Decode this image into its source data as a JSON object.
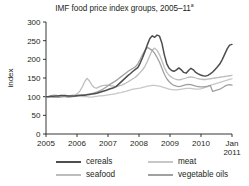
{
  "chart_data": {
    "type": "line",
    "title": "IMF food price index groups, 2005–11",
    "title_superscript": "a",
    "xlabel": "",
    "ylabel": "index",
    "ylim": [
      0,
      300
    ],
    "yticks": [
      0,
      50,
      100,
      150,
      200,
      250,
      300
    ],
    "xticks": [
      "2005",
      "2006",
      "2007",
      "2008",
      "2009",
      "2010",
      "Jan 2011"
    ],
    "xtick_last_line1": "Jan",
    "xtick_last_line2": "2011",
    "xlim": [
      2005.0,
      2011.0
    ],
    "grid": false,
    "legend_position": "below",
    "note": "Monthly index values, Jan 2005 = 100",
    "series": [
      {
        "name": "cereals",
        "color": "#4d4d4d",
        "values": [
          100,
          100,
          101,
          101,
          102,
          102,
          103,
          103,
          103,
          102,
          102,
          102,
          102,
          103,
          104,
          104,
          104,
          105,
          106,
          107,
          108,
          109,
          111,
          113,
          115,
          117,
          120,
          122,
          124,
          127,
          133,
          139,
          145,
          151,
          157,
          162,
          168,
          173,
          178,
          190,
          205,
          222,
          240,
          256,
          263,
          259,
          265,
          262,
          243,
          212,
          188,
          176,
          170,
          168,
          172,
          177,
          172,
          165,
          163,
          170,
          176,
          172,
          165,
          161,
          158,
          156,
          155,
          157,
          161,
          166,
          173,
          180,
          188,
          200,
          214,
          228,
          238,
          240
        ]
      },
      {
        "name": "seafood",
        "color": "#bdbdbd",
        "values": [
          100,
          101,
          103,
          104,
          104,
          103,
          102,
          101,
          101,
          102,
          103,
          104,
          105,
          108,
          115,
          126,
          140,
          149,
          142,
          131,
          124,
          123,
          126,
          129,
          130,
          131,
          130,
          129,
          128,
          127,
          128,
          130,
          133,
          136,
          140,
          144,
          148,
          152,
          158,
          165,
          172,
          182,
          195,
          210,
          225,
          230,
          224,
          212,
          196,
          178,
          165,
          157,
          152,
          148,
          146,
          145,
          146,
          148,
          150,
          152,
          153,
          152,
          150,
          148,
          147,
          146,
          146,
          147,
          148,
          149,
          150,
          151,
          152,
          153,
          154,
          155,
          156,
          157
        ]
      },
      {
        "name": "meat",
        "color": "#c7c7c7",
        "values": [
          100,
          100,
          100,
          99,
          99,
          99,
          100,
          100,
          100,
          100,
          101,
          101,
          101,
          101,
          101,
          100,
          100,
          100,
          99,
          99,
          100,
          101,
          102,
          102,
          103,
          104,
          105,
          106,
          107,
          108,
          110,
          111,
          113,
          114,
          116,
          118,
          120,
          121,
          122,
          123,
          125,
          126,
          128,
          129,
          130,
          130,
          129,
          128,
          126,
          124,
          122,
          120,
          119,
          118,
          118,
          119,
          120,
          121,
          122,
          122,
          122,
          121,
          120,
          120,
          121,
          123,
          125,
          127,
          130,
          132,
          134,
          136,
          138,
          140,
          142,
          144,
          146,
          148
        ]
      },
      {
        "name": "vegetable oils",
        "color": "#a0a0a0",
        "values": [
          100,
          100,
          99,
          99,
          98,
          98,
          99,
          100,
          100,
          99,
          99,
          100,
          101,
          102,
          103,
          104,
          105,
          106,
          107,
          108,
          110,
          112,
          115,
          118,
          122,
          126,
          131,
          135,
          139,
          143,
          148,
          153,
          158,
          163,
          168,
          172,
          176,
          180,
          188,
          200,
          213,
          224,
          232,
          228,
          224,
          216,
          205,
          192,
          176,
          160,
          148,
          140,
          134,
          130,
          128,
          127,
          128,
          130,
          132,
          133,
          132,
          130,
          128,
          127,
          126,
          126,
          127,
          128,
          130,
          114,
          116,
          118,
          120,
          124,
          128,
          131,
          132,
          131
        ]
      }
    ]
  },
  "legend": {
    "items": [
      {
        "label": "cereals",
        "color": "#4d4d4d"
      },
      {
        "label": "seafood",
        "color": "#bdbdbd"
      },
      {
        "label": "meat",
        "color": "#c7c7c7"
      },
      {
        "label": "vegetable oils",
        "color": "#a0a0a0"
      }
    ]
  }
}
